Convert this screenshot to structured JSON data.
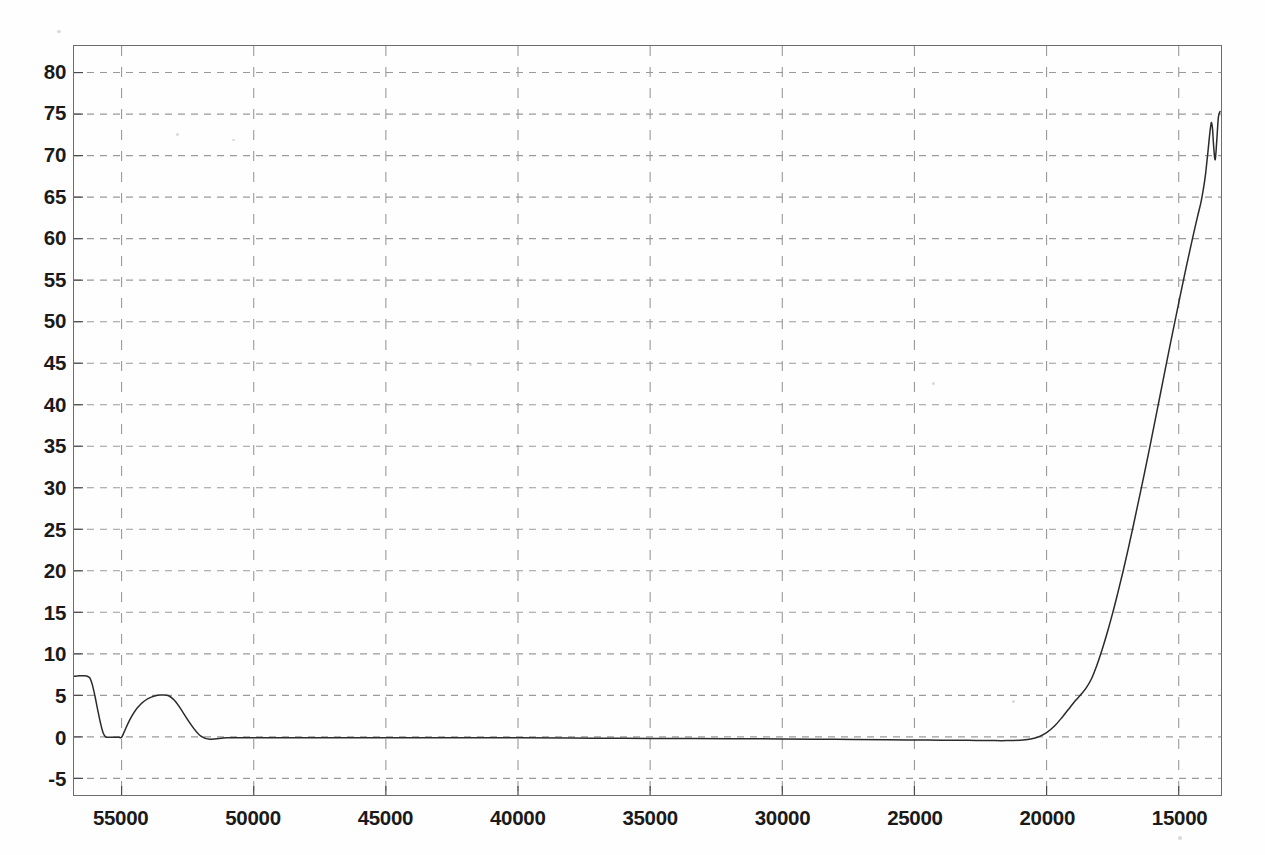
{
  "chart_data": {
    "type": "line",
    "title": "",
    "subtitle": "",
    "xlabel": "",
    "ylabel": "",
    "legend": [],
    "legend_position": "none",
    "grid": true,
    "grid_style": "dashed",
    "grid_color": "#9a9a9a",
    "line_color": "#2b2b2b",
    "background_color": "#ffffff",
    "frame_color": "#6d6d6d",
    "x_reversed": true,
    "xlim": [
      56800,
      13400
    ],
    "ylim": [
      -7.0,
      83.2
    ],
    "xticks": [
      55000,
      50000,
      45000,
      40000,
      35000,
      30000,
      25000,
      20000,
      15000
    ],
    "xtick_labels": [
      "55000",
      "50000",
      "45000",
      "40000",
      "35000",
      "30000",
      "25000",
      "20000",
      "15000"
    ],
    "yticks": [
      -5,
      0,
      5,
      10,
      15,
      20,
      25,
      30,
      35,
      40,
      45,
      50,
      55,
      60,
      65,
      70,
      75,
      80
    ],
    "ytick_labels": [
      "-5",
      "0",
      "5",
      "10",
      "15",
      "20",
      "25",
      "30",
      "35",
      "40",
      "45",
      "50",
      "55",
      "60",
      "65",
      "70",
      "75",
      "80"
    ],
    "series": [
      {
        "name": "spectrum",
        "x": [
          56800,
          56600,
          56400,
          56300,
          56200,
          56100,
          56000,
          55900,
          55800,
          55700,
          55600,
          55500,
          55400,
          55300,
          55200,
          55100,
          55000,
          54900,
          54700,
          54400,
          54000,
          53500,
          53000,
          52000,
          51000,
          50000,
          48000,
          46000,
          44000,
          42000,
          40000,
          38000,
          36000,
          34000,
          32000,
          30000,
          28000,
          26000,
          25000,
          24000,
          23000,
          22000,
          21500,
          21000,
          20600,
          20300,
          20000,
          19700,
          19400,
          19100,
          18900,
          18700,
          18500,
          18300,
          18100,
          17900,
          17700,
          17500,
          17300,
          17100,
          16900,
          16700,
          16500,
          16300,
          16100,
          15900,
          15700,
          15500,
          15300,
          15100,
          14900,
          14700,
          14500,
          14300,
          14150,
          14050,
          13980,
          13930,
          13880,
          13840,
          13800,
          13760,
          13720,
          13680,
          13620,
          13560,
          13500,
          13440
        ],
        "y": [
          7.3,
          7.35,
          7.35,
          7.3,
          7.1,
          6.2,
          4.8,
          3.2,
          1.7,
          0.5,
          0.0,
          -0.05,
          -0.05,
          -0.05,
          -0.05,
          -0.05,
          -0.05,
          0.6,
          2.0,
          3.5,
          4.6,
          5.05,
          4.4,
          0.1,
          -0.1,
          -0.1,
          -0.1,
          -0.1,
          -0.1,
          -0.1,
          -0.12,
          -0.15,
          -0.18,
          -0.2,
          -0.22,
          -0.25,
          -0.3,
          -0.35,
          -0.38,
          -0.4,
          -0.42,
          -0.45,
          -0.45,
          -0.4,
          -0.25,
          0.0,
          0.5,
          1.3,
          2.4,
          3.6,
          4.4,
          5.1,
          5.9,
          7.0,
          8.6,
          10.5,
          12.6,
          14.9,
          17.4,
          20.0,
          22.8,
          25.7,
          28.7,
          31.7,
          34.8,
          38.0,
          41.2,
          44.4,
          47.6,
          50.7,
          53.8,
          56.8,
          59.7,
          62.5,
          64.5,
          66.3,
          67.9,
          69.4,
          70.9,
          72.2,
          73.3,
          74.0,
          73.2,
          71.2,
          69.5,
          71.8,
          74.6,
          75.3
        ]
      }
    ]
  }
}
